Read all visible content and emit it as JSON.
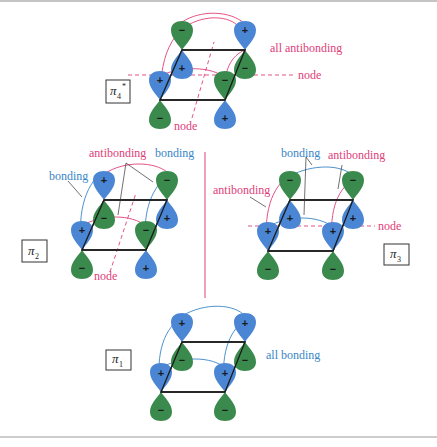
{
  "colors": {
    "positive_lobe": "#4a86d4",
    "negative_lobe": "#3a8a4e",
    "antibonding": "#e0407a",
    "bonding": "#3a86c8",
    "frame": "#1a1a1a",
    "border_line": "#9a9a9a"
  },
  "orbitals": {
    "pi4": {
      "label_main": "π",
      "label_sub": "4",
      "label_sup": "*",
      "annotations": {
        "summary": "all antibonding",
        "node_horizontal": "node",
        "node_diagonal": "node"
      },
      "signs": {
        "back_left_top": "−",
        "back_left_bottom": "+",
        "back_right_top": "+",
        "back_right_bottom": "−",
        "front_left_top": "+",
        "front_left_bottom": "−",
        "front_right_top": "−",
        "front_right_bottom": "+"
      }
    },
    "pi2": {
      "label_main": "π",
      "label_sub": "2",
      "annotations": {
        "antibonding": "antibonding",
        "bonding_left": "bonding",
        "bonding_right": "bonding",
        "node": "node"
      },
      "signs": {
        "back_left_top": "+",
        "back_left_bottom": "−",
        "back_right_top": "−",
        "back_right_bottom": "+",
        "front_left_top": "+",
        "front_left_bottom": "−",
        "front_right_top": "−",
        "front_right_bottom": "+"
      }
    },
    "pi3": {
      "label_main": "π",
      "label_sub": "3",
      "annotations": {
        "bonding": "bonding",
        "antibonding_right": "antibonding",
        "antibonding_left": "antibonding",
        "node": "node"
      },
      "signs": {
        "back_left_top": "−",
        "back_left_bottom": "+",
        "back_right_top": "−",
        "back_right_bottom": "+",
        "front_left_top": "+",
        "front_left_bottom": "−",
        "front_right_top": "+",
        "front_right_bottom": "−"
      }
    },
    "pi1": {
      "label_main": "π",
      "label_sub": "1",
      "annotations": {
        "summary": "all bonding"
      },
      "signs": {
        "back_left_top": "+",
        "back_left_bottom": "−",
        "back_right_top": "+",
        "back_right_bottom": "−",
        "front_left_top": "+",
        "front_left_bottom": "−",
        "front_right_top": "+",
        "front_right_bottom": "−"
      }
    }
  }
}
